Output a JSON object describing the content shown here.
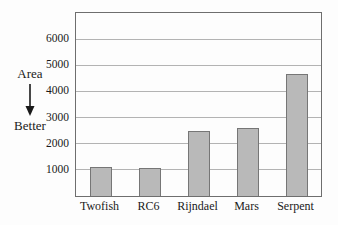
{
  "annotation": {
    "top_label": "Area",
    "bottom_label": "Better",
    "arrow_icon": "down-arrow-icon"
  },
  "chart_data": {
    "type": "bar",
    "categories": [
      "Twofish",
      "RC6",
      "Rijndael",
      "Mars",
      "Serpent"
    ],
    "values": [
      1100,
      1060,
      2500,
      2600,
      4650
    ],
    "title": "",
    "xlabel": "",
    "ylabel": "Area",
    "yticks": [
      1000,
      2000,
      3000,
      4000,
      5000,
      6000
    ],
    "ylim": [
      0,
      7000
    ],
    "grid": true,
    "legend": false,
    "annotation_text": "Area → Better (downward arrow: lower area is better)",
    "colors": {
      "bar_fill": "#b9b9b9",
      "bar_border": "#767676",
      "gridline": "#b3b3b3",
      "plot_border": "#6e6e6e",
      "text": "#1a1a1a",
      "background": "#fdfdfd"
    }
  }
}
